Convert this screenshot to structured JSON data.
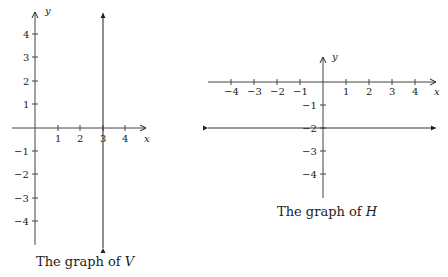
{
  "graphs": [
    {
      "id": "V",
      "caption_prefix": "The graph of ",
      "caption_var": "V",
      "axis_x_label": "x",
      "axis_y_label": "y",
      "x_ticks": [
        "1",
        "2",
        "3",
        "4"
      ],
      "y_ticks_pos": [
        "4",
        "3",
        "2",
        "1"
      ],
      "y_ticks_neg": [
        "−1",
        "−2",
        "−3",
        "−4"
      ],
      "line": "vertical line x = 3"
    },
    {
      "id": "H",
      "caption_prefix": "The graph of ",
      "caption_var": "H",
      "axis_x_label": "x",
      "axis_y_label": "y",
      "x_ticks_neg": [
        "−4",
        "−3",
        "−2",
        "−1"
      ],
      "x_ticks_pos": [
        "1",
        "2",
        "3",
        "4"
      ],
      "y_ticks_neg": [
        "−1",
        "−2",
        "−3",
        "−4"
      ],
      "line": "horizontal line y = −2"
    }
  ]
}
